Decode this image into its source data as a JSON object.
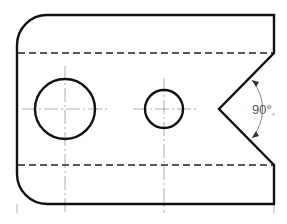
{
  "diagram": {
    "type": "technical-drawing",
    "colors": {
      "outline": "#111111",
      "centerline": "#999999",
      "dimension": "#777777",
      "background": "#ffffff"
    },
    "outline": {
      "left": 17,
      "right": 274,
      "top": 15,
      "bottom": 204,
      "corner_radius": 30
    },
    "hidden_lines": [
      {
        "y": 53,
        "x1": 17,
        "x2": 274
      },
      {
        "y": 165,
        "x1": 17,
        "x2": 274
      }
    ],
    "v_notch": {
      "top": [
        274,
        53
      ],
      "vertex": [
        219,
        109
      ],
      "bottom": [
        274,
        165
      ],
      "angle_label": "90°"
    },
    "holes": [
      {
        "name": "large-hole",
        "cx": 65,
        "cy": 109,
        "r": 30
      },
      {
        "name": "small-hole",
        "cx": 164,
        "cy": 109,
        "r": 19
      }
    ],
    "centerlines": {
      "horizontal_y": 109,
      "vertical_x": [
        17,
        65,
        164,
        274
      ]
    }
  }
}
